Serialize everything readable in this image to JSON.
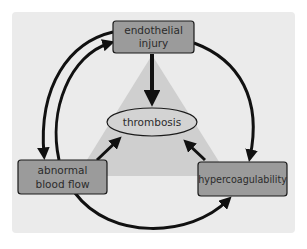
{
  "diagram": {
    "nodes": {
      "endothelial_injury": {
        "lines": [
          "endothelial",
          "injury"
        ]
      },
      "abnormal_blood_flow": {
        "lines": [
          "abnormal",
          "blood flow"
        ]
      },
      "hypercoagulability": {
        "lines": [
          "hypercoagulability"
        ]
      },
      "thrombosis": {
        "label": "thrombosis"
      }
    },
    "edges": [
      {
        "from": "endothelial_injury",
        "to": "thrombosis"
      },
      {
        "from": "abnormal_blood_flow",
        "to": "thrombosis"
      },
      {
        "from": "hypercoagulability",
        "to": "thrombosis"
      },
      {
        "from": "endothelial_injury",
        "to": "abnormal_blood_flow"
      },
      {
        "from": "abnormal_blood_flow",
        "to": "endothelial_injury"
      },
      {
        "from": "endothelial_injury",
        "to": "hypercoagulability"
      },
      {
        "from": "abnormal_blood_flow",
        "to": "hypercoagulability"
      }
    ],
    "colors": {
      "panel": "#ebebeb",
      "triangle": "#cfcfcf",
      "box_fill": "#9b9b9b",
      "stroke": "#1a1a1a",
      "text": "#2b2b2b"
    }
  }
}
